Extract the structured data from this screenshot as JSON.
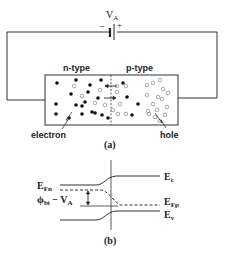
{
  "figure_a": {
    "caption": "(a)",
    "battery": {
      "label": "V",
      "label_sub": "A",
      "minus": "−",
      "plus": "+"
    },
    "regions": {
      "n_label": "n-type",
      "p_label": "p-type"
    },
    "callouts": {
      "electron": "electron",
      "hole": "hole"
    },
    "electrons": [
      [
        57,
        83
      ],
      [
        76,
        80
      ],
      [
        101,
        80
      ],
      [
        90,
        85
      ],
      [
        71,
        94
      ],
      [
        88,
        92
      ],
      [
        98,
        98
      ],
      [
        85,
        102
      ],
      [
        56,
        104
      ],
      [
        76,
        105
      ],
      [
        82,
        106
      ],
      [
        92,
        112
      ],
      [
        56,
        114
      ],
      [
        82,
        114
      ],
      [
        95,
        113
      ],
      [
        102,
        115
      ],
      [
        108,
        118
      ],
      [
        69,
        118
      ],
      [
        123,
        83
      ],
      [
        127,
        97
      ],
      [
        138,
        104
      ],
      [
        132,
        115
      ]
    ],
    "holes": [
      [
        74,
        86
      ],
      [
        82,
        96
      ],
      [
        95,
        103
      ],
      [
        100,
        90
      ],
      [
        105,
        105
      ],
      [
        117,
        86
      ],
      [
        126,
        86
      ],
      [
        117,
        92
      ],
      [
        120,
        104
      ],
      [
        113,
        110
      ],
      [
        118,
        114
      ],
      [
        126,
        114
      ],
      [
        147,
        85
      ],
      [
        153,
        83
      ],
      [
        160,
        80
      ],
      [
        163,
        89
      ],
      [
        168,
        93
      ],
      [
        147,
        95
      ],
      [
        158,
        97
      ],
      [
        162,
        99
      ],
      [
        153,
        104
      ],
      [
        157,
        110
      ],
      [
        149,
        114
      ],
      [
        167,
        107
      ],
      [
        165,
        115
      ],
      [
        148,
        111
      ],
      [
        155,
        117
      ],
      [
        160,
        121
      ]
    ]
  },
  "figure_b": {
    "caption": "(b)",
    "labels": {
      "Ec": "E",
      "Ec_sub": "c",
      "Ev": "E",
      "Ev_sub": "v",
      "EFn": "E",
      "EFn_sub": "Fn",
      "EFp": "E",
      "EFp_sub": "Fp",
      "barrier": "ϕ",
      "barrier_sub": "bi",
      "barrier_minus": " − V",
      "barrier_minus_sub": "A"
    }
  }
}
